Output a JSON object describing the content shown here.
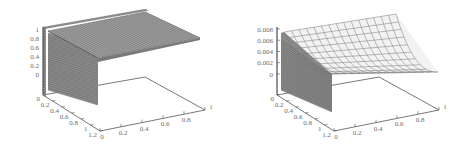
{
  "chart_data": [
    {
      "type": "surface3d",
      "title": "",
      "xlabel": "",
      "ylabel": "",
      "zlabel": "",
      "x_ticks": [
        "0",
        "0.2",
        "0.4",
        "0.6",
        "0.8",
        "1"
      ],
      "y_ticks": [
        "0",
        "0.2",
        "0.4",
        "0.6",
        "0.8",
        "1",
        "1.2"
      ],
      "z_ticks": [
        "0",
        "0.2",
        "0.4",
        "0.6",
        "0.8",
        "1"
      ],
      "xlim": [
        0,
        1
      ],
      "ylim": [
        0,
        1.2
      ],
      "zlim": [
        0,
        1
      ],
      "description": "Surface approx. 1 over region near y=0, dropping steeply (vertical wall) to 0 by y≈0.05; flat plateau along x",
      "surface_samples": {
        "x": [
          0,
          0.2,
          0.4,
          0.6,
          0.8,
          1
        ],
        "y": [
          0,
          0.02,
          0.05,
          0.1,
          0.5,
          1.0
        ],
        "z_by_y": [
          1,
          0.95,
          0.05,
          0,
          0,
          0
        ]
      },
      "grid": false,
      "legend": null
    },
    {
      "type": "surface3d",
      "title": "",
      "xlabel": "",
      "ylabel": "",
      "zlabel": "",
      "x_ticks": [
        "0",
        "0.2",
        "0.4",
        "0.6",
        "0.8",
        "1"
      ],
      "y_ticks": [
        "0",
        "0.2",
        "0.4",
        "0.6",
        "0.8",
        "1",
        "1.2"
      ],
      "z_ticks": [
        "0",
        "0.002",
        "0.004",
        "0.006",
        "0.008"
      ],
      "xlim": [
        0,
        1
      ],
      "ylim": [
        0,
        1.2
      ],
      "zlim": [
        0,
        0.008
      ],
      "description": "Surface ≈0.008 at x=0 decaying smoothly toward ≈0 as x→1; steep drop near y=0",
      "surface_samples": {
        "x": [
          0,
          0.2,
          0.4,
          0.6,
          0.8,
          1
        ],
        "z_by_x": [
          0.008,
          0.0055,
          0.0035,
          0.002,
          0.001,
          0.0003
        ]
      },
      "grid": false,
      "legend": null
    }
  ],
  "panels": {
    "left": {
      "z_ticks": [
        "1",
        "0.8",
        "0.6",
        "0.4",
        "0.2",
        "0"
      ],
      "y_ticks": [
        "0",
        "0.2",
        "0.4",
        "0.6",
        "0.8",
        "1",
        "1.2"
      ],
      "x_ticks": [
        "0",
        "0.2",
        "0.4",
        "0.6",
        "0.8",
        "1"
      ]
    },
    "right": {
      "z_ticks": [
        "0.008",
        "0.006",
        "0.004",
        "0.002",
        "0"
      ],
      "y_ticks": [
        "0",
        "0.2",
        "0.4",
        "0.6",
        "0.8",
        "1",
        "1.2"
      ],
      "x_ticks": [
        "0",
        "0.2",
        "0.4",
        "0.6",
        "0.8",
        "1"
      ]
    }
  },
  "colors": {
    "axis": "#555555",
    "mesh": "#777777",
    "mesh_dark": "#5a5a5a",
    "text": "#6b6b6b",
    "background": "#ffffff"
  }
}
